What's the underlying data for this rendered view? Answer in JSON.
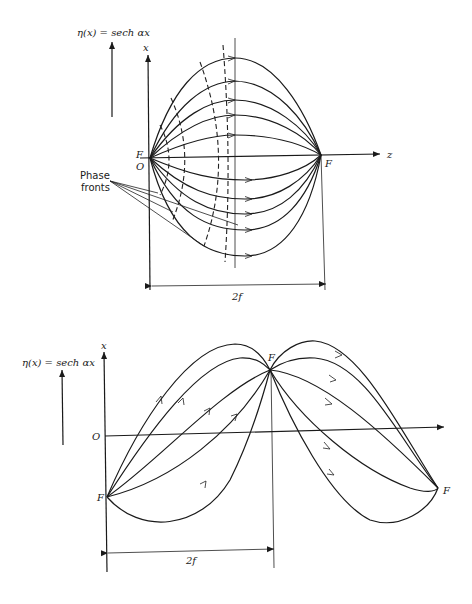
{
  "figure_top": {
    "index_label": "η(x) = sech αx",
    "axis_x_label": "x",
    "axis_z_label": "z",
    "focus_left_label": "F",
    "origin_label": "O",
    "focus_right_label": "F",
    "phase_fronts_label_line1": "Phase",
    "phase_fronts_label_line2": "fronts",
    "dimension_label": "2f"
  },
  "figure_bottom": {
    "index_label": "η(x) = sech αx",
    "axis_x_label": "x",
    "origin_label": "O",
    "focus_left_label": "F",
    "focus_center_label": "F",
    "focus_right_label": "F",
    "dimension_label": "2f"
  },
  "colors": {
    "ink": "#1a1a1a",
    "paper": "#ffffff"
  }
}
